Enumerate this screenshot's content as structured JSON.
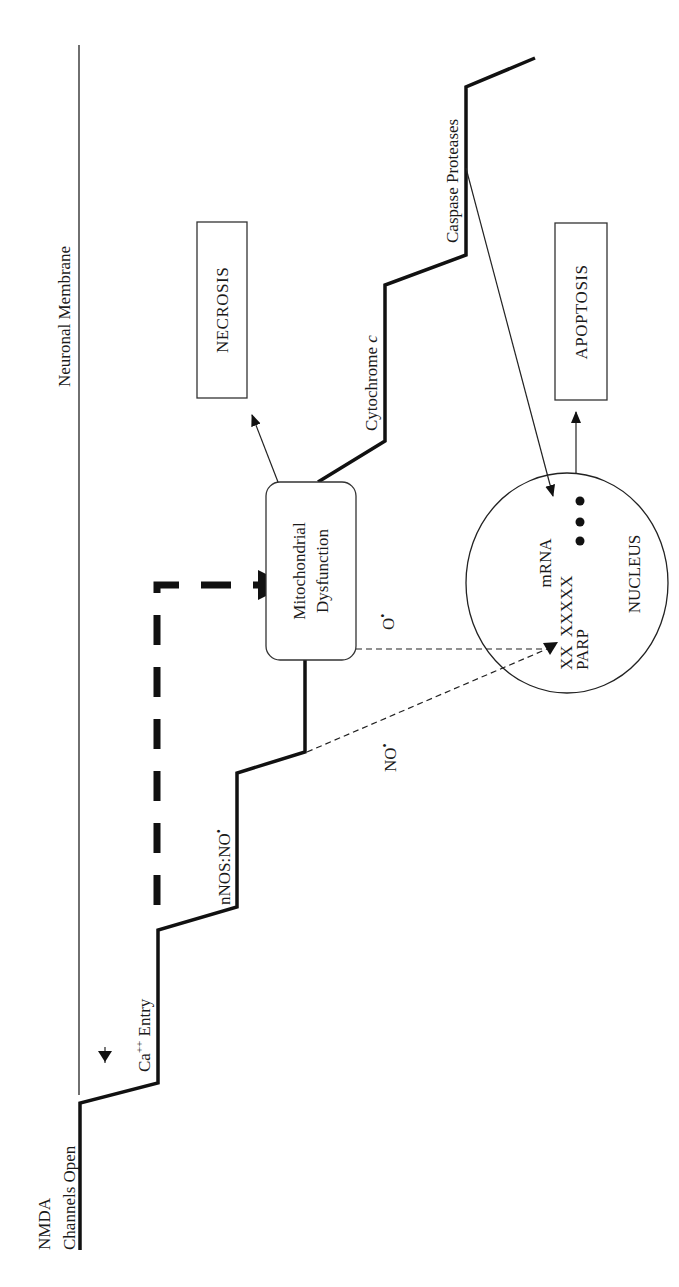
{
  "figure": {
    "orientation": "rotated -90deg (read bottom-to-top)",
    "membrane_label": "Neuronal Membrane",
    "steps": [
      {
        "id": "nmda",
        "line1": "NMDA",
        "line2": "Channels Open"
      },
      {
        "id": "ca",
        "label": "Ca",
        "superscript": "++",
        "suffix": " Entry"
      },
      {
        "id": "nnos",
        "label": "nNOS:NO",
        "superscript": "•"
      },
      {
        "id": "mito",
        "line1": "Mitochondrial",
        "line2": "Dysfunction"
      },
      {
        "id": "cyto",
        "label": "Cytochrome ",
        "italic": "c"
      },
      {
        "id": "caspase",
        "label": "Caspase Proteases"
      }
    ],
    "outcomes": {
      "necrosis": "NECROSIS",
      "apoptosis": "APOPTOSIS"
    },
    "radicals": {
      "superoxide": {
        "label": "O",
        "superscript": "•"
      },
      "nitric_oxide": {
        "label": "NO",
        "superscript": "•"
      }
    },
    "nucleus": {
      "title": "NUCLEUS",
      "mrna": "mRNA",
      "dna": "XX  XXXXX",
      "parp": "PARP",
      "dots": "● ● ●"
    },
    "colors": {
      "line": "#111111",
      "text": "#1a1a1a",
      "background": "#ffffff"
    }
  }
}
